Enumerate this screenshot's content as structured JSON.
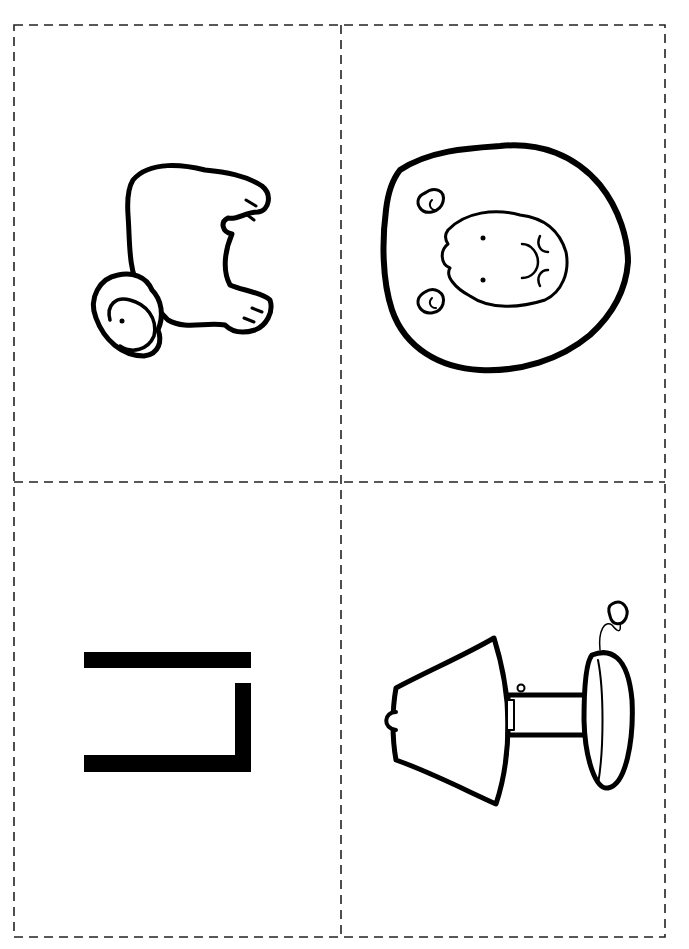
{
  "sheet": {
    "type": "flashcard-cut-sheet",
    "layout": "2x2 grid with dashed cut lines",
    "colors": {
      "ink": "#000000",
      "paper": "#ffffff",
      "cut_line": "#222222"
    }
  },
  "cards": [
    {
      "position": "top-left",
      "picture": "lamb",
      "icon": "lamb-icon",
      "rotation": "90deg"
    },
    {
      "position": "top-right",
      "picture": "lion",
      "icon": "lion-icon",
      "rotation": "90deg"
    },
    {
      "position": "bottom-left",
      "picture": "letter L",
      "icon": "letter-l-icon",
      "rotation": "90deg"
    },
    {
      "position": "bottom-right",
      "picture": "lamp",
      "icon": "lamp-icon",
      "rotation": "90deg"
    }
  ]
}
